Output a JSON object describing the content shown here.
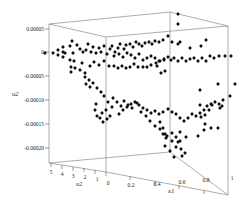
{
  "chart_data": {
    "type": "scatter",
    "projection": "3d",
    "title": "",
    "xlabel": "x1",
    "ylabel": "x2",
    "zlabel": "u2",
    "x_range": [
      0,
      1
    ],
    "y_range": [
      0,
      5
    ],
    "z_range": [
      -0.0002,
      5e-05
    ],
    "x_ticks": [
      "0",
      "0.2",
      "0.4",
      "0.6",
      "0.8",
      "1"
    ],
    "y_ticks": [
      "5",
      "4",
      "3",
      "2",
      "1",
      "0"
    ],
    "z_ticks": [
      "0.00005",
      "0",
      "-0.00005",
      "-0.00010",
      "-0.00015",
      "-0.00020"
    ],
    "grid": false,
    "legend": null,
    "marker": "diamond",
    "marker_color": "#111111",
    "frame": {
      "color": "#8a8a8a",
      "corners_px": {
        "top_left_back": [
          49,
          24
        ],
        "top_mid_back": [
          170,
          12
        ],
        "top_right": [
          228,
          26
        ],
        "top_front": [
          106,
          37
        ],
        "bottom_left": [
          49,
          163
        ],
        "bottom_front": [
          106,
          172
        ],
        "bottom_mid_back": [
          170,
          152
        ],
        "bottom_right": [
          228,
          195
        ]
      }
    },
    "points_px": [
      [
        45,
        53
      ],
      [
        53,
        53
      ],
      [
        58,
        50
      ],
      [
        58,
        55
      ],
      [
        63,
        47
      ],
      [
        63,
        52
      ],
      [
        63,
        57
      ],
      [
        65,
        53
      ],
      [
        70,
        46
      ],
      [
        72,
        41
      ],
      [
        77,
        45
      ],
      [
        73,
        53
      ],
      [
        80,
        49
      ],
      [
        83,
        52
      ],
      [
        86,
        50
      ],
      [
        88,
        44
      ],
      [
        91,
        52
      ],
      [
        93,
        47
      ],
      [
        96,
        53
      ],
      [
        99,
        48
      ],
      [
        101,
        52
      ],
      [
        104,
        46
      ],
      [
        107,
        54
      ],
      [
        110,
        49
      ],
      [
        112,
        46
      ],
      [
        115,
        52
      ],
      [
        118,
        48
      ],
      [
        120,
        44
      ],
      [
        124,
        49
      ],
      [
        126,
        45
      ],
      [
        130,
        44
      ],
      [
        133,
        47
      ],
      [
        136,
        42
      ],
      [
        139,
        44
      ],
      [
        142,
        46
      ],
      [
        145,
        43
      ],
      [
        149,
        42
      ],
      [
        152,
        44
      ],
      [
        155,
        41
      ],
      [
        159,
        42
      ],
      [
        163,
        40
      ],
      [
        168,
        36
      ],
      [
        172,
        42
      ],
      [
        178,
        44
      ],
      [
        180,
        42
      ],
      [
        190,
        48
      ],
      [
        201,
        46
      ],
      [
        206,
        40
      ],
      [
        178,
        24
      ],
      [
        178,
        14
      ],
      [
        114,
        56
      ],
      [
        119,
        54
      ],
      [
        123,
        57
      ],
      [
        127,
        53
      ],
      [
        131,
        55
      ],
      [
        135,
        58
      ],
      [
        139,
        54
      ],
      [
        143,
        60
      ],
      [
        147,
        58
      ],
      [
        151,
        56
      ],
      [
        155,
        58
      ],
      [
        159,
        61
      ],
      [
        164,
        59
      ],
      [
        168,
        57
      ],
      [
        171,
        60
      ],
      [
        174,
        58
      ],
      [
        178,
        61
      ],
      [
        182,
        58
      ],
      [
        186,
        61
      ],
      [
        190,
        59
      ],
      [
        194,
        58
      ],
      [
        198,
        61
      ],
      [
        202,
        58
      ],
      [
        206,
        61
      ],
      [
        210,
        56
      ],
      [
        214,
        58
      ],
      [
        219,
        56
      ],
      [
        225,
        56
      ],
      [
        231,
        56
      ],
      [
        70,
        60
      ],
      [
        74,
        61
      ],
      [
        71,
        67
      ],
      [
        71,
        72
      ],
      [
        75,
        68
      ],
      [
        80,
        70
      ],
      [
        82,
        63
      ],
      [
        85,
        73
      ],
      [
        90,
        66
      ],
      [
        94,
        62
      ],
      [
        99,
        65
      ],
      [
        104,
        61
      ],
      [
        109,
        66
      ],
      [
        114,
        66
      ],
      [
        118,
        68
      ],
      [
        122,
        66
      ],
      [
        126,
        68
      ],
      [
        130,
        67
      ],
      [
        134,
        64
      ],
      [
        138,
        67
      ],
      [
        143,
        67
      ],
      [
        147,
        67
      ],
      [
        151,
        65
      ],
      [
        156,
        63
      ],
      [
        160,
        61
      ],
      [
        164,
        60
      ],
      [
        157,
        66
      ],
      [
        161,
        73
      ],
      [
        165,
        71
      ],
      [
        85,
        77
      ],
      [
        86,
        84
      ],
      [
        89,
        80
      ],
      [
        90,
        87
      ],
      [
        93,
        83
      ],
      [
        97,
        88
      ],
      [
        101,
        92
      ],
      [
        104,
        96
      ],
      [
        108,
        102
      ],
      [
        113,
        98
      ],
      [
        117,
        102
      ],
      [
        121,
        106
      ],
      [
        124,
        101
      ],
      [
        128,
        105
      ],
      [
        132,
        108
      ],
      [
        137,
        103
      ],
      [
        141,
        112
      ],
      [
        146,
        116
      ],
      [
        150,
        121
      ],
      [
        155,
        126
      ],
      [
        160,
        129
      ],
      [
        163,
        134
      ],
      [
        167,
        136
      ],
      [
        172,
        133
      ],
      [
        176,
        137
      ],
      [
        178,
        142
      ],
      [
        180,
        132
      ],
      [
        96,
        104
      ],
      [
        95,
        110
      ],
      [
        97,
        116
      ],
      [
        100,
        118
      ],
      [
        102,
        113
      ],
      [
        103,
        122
      ],
      [
        107,
        119
      ],
      [
        106,
        110
      ],
      [
        112,
        107
      ],
      [
        110,
        116
      ],
      [
        119,
        114
      ],
      [
        123,
        110
      ],
      [
        127,
        107
      ],
      [
        131,
        104
      ],
      [
        135,
        102
      ],
      [
        139,
        105
      ],
      [
        143,
        108
      ],
      [
        147,
        110
      ],
      [
        151,
        113
      ],
      [
        155,
        111
      ],
      [
        159,
        114
      ],
      [
        163,
        112
      ],
      [
        168,
        109
      ],
      [
        172,
        112
      ],
      [
        176,
        114
      ],
      [
        180,
        118
      ],
      [
        184,
        121
      ],
      [
        188,
        118
      ],
      [
        192,
        114
      ],
      [
        196,
        116
      ],
      [
        200,
        113
      ],
      [
        204,
        110
      ],
      [
        207,
        106
      ],
      [
        211,
        104
      ],
      [
        215,
        102
      ],
      [
        219,
        104
      ],
      [
        223,
        100
      ],
      [
        200,
        105
      ],
      [
        205,
        115
      ],
      [
        209,
        110
      ],
      [
        212,
        105
      ],
      [
        160,
        122
      ],
      [
        163,
        128
      ],
      [
        165,
        134
      ],
      [
        166,
        138
      ],
      [
        165,
        146
      ],
      [
        170,
        151
      ],
      [
        174,
        157
      ],
      [
        182,
        156
      ],
      [
        181,
        149
      ],
      [
        185,
        153
      ],
      [
        176,
        147
      ],
      [
        180,
        141
      ],
      [
        172,
        141
      ],
      [
        186,
        137
      ],
      [
        198,
        136
      ],
      [
        201,
        117
      ],
      [
        204,
        130
      ],
      [
        218,
        128
      ],
      [
        220,
        108
      ],
      [
        222,
        106
      ],
      [
        230,
        96
      ],
      [
        218,
        84
      ],
      [
        235,
        84
      ],
      [
        200,
        90
      ],
      [
        211,
        128
      ],
      [
        205,
        124
      ]
    ]
  }
}
